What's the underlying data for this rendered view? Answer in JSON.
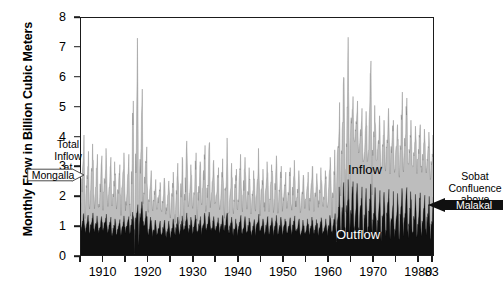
{
  "chart_data": {
    "type": "area",
    "title": "",
    "subtitle": "",
    "xlabel": "",
    "ylabel": "Monthly Flow in Billion Cubic Meters",
    "xlim": [
      1905,
      1983.5
    ],
    "ylim": [
      0,
      8
    ],
    "grid": false,
    "legend_position": "in-plot annotations",
    "y_ticks": [
      0,
      1,
      2,
      3,
      4,
      5,
      6,
      7,
      8
    ],
    "y_tick_labels": [
      "0",
      "1",
      "2",
      "3",
      "4",
      "5",
      "6",
      "7",
      "8"
    ],
    "x_ticks": [
      1905,
      1910,
      1915,
      1920,
      1925,
      1930,
      1935,
      1940,
      1945,
      1950,
      1955,
      1960,
      1965,
      1970,
      1975,
      1980,
      1983
    ],
    "x_tick_labels": [
      "",
      "1910",
      "",
      "1920",
      "",
      "1930",
      "",
      "1940",
      "",
      "1950",
      "",
      "1960",
      "",
      "1970",
      "",
      "1980",
      "83"
    ],
    "colors": {
      "inflow_fill": "#bdbdbd",
      "outflow_fill": "#101010",
      "axis": "#1b1b1b",
      "background": "#ffffff",
      "inflow_label_color": "#000000",
      "outflow_label_color": "#ffffff"
    },
    "series": [
      {
        "name": "Inflow",
        "description": "Total Inflow at Mongalla",
        "fill": "#bdbdbd",
        "stacking": "overlay-top",
        "annual_mean": [
          2.45,
          2.38,
          2.52,
          2.35,
          2.3,
          2.55,
          2.28,
          2.2,
          2.15,
          2.4,
          2.32,
          2.48,
          3.1,
          3.35,
          2.6,
          2.1,
          1.95,
          1.88,
          1.92,
          1.85,
          1.98,
          2.05,
          2.12,
          2.35,
          2.18,
          2.28,
          2.22,
          2.4,
          2.45,
          2.25,
          2.18,
          2.3,
          2.42,
          2.2,
          2.1,
          2.35,
          2.28,
          2.15,
          2.05,
          2.38,
          2.12,
          2.25,
          2.18,
          2.3,
          2.2,
          2.08,
          2.15,
          2.28,
          2.12,
          2.0,
          2.1,
          2.22,
          2.05,
          2.18,
          2.12,
          2.35,
          2.28,
          3.35,
          4.15,
          4.0,
          4.45,
          4.3,
          3.95,
          3.75,
          4.25,
          3.95,
          3.7,
          3.55,
          3.8,
          3.62,
          3.5,
          3.72,
          3.88,
          3.6,
          3.45,
          3.55,
          3.4,
          3.3,
          3.25
        ],
        "annual_max": [
          4.05,
          3.5,
          3.75,
          3.4,
          3.35,
          3.6,
          3.3,
          3.15,
          3.05,
          3.45,
          3.4,
          5.2,
          7.32,
          5.6,
          3.65,
          2.85,
          2.55,
          2.45,
          2.6,
          2.5,
          2.8,
          3.1,
          3.3,
          3.85,
          3.05,
          3.45,
          3.15,
          3.7,
          3.8,
          3.2,
          2.95,
          3.25,
          3.95,
          3.1,
          2.9,
          3.4,
          3.3,
          2.95,
          2.85,
          3.6,
          2.9,
          3.15,
          3.05,
          3.35,
          3.0,
          2.8,
          2.95,
          3.2,
          2.85,
          2.7,
          2.8,
          3.0,
          2.75,
          2.95,
          2.85,
          3.3,
          3.55,
          5.15,
          6.0,
          7.35,
          5.35,
          5.2,
          4.95,
          4.85,
          6.55,
          5.05,
          4.7,
          4.55,
          4.95,
          4.55,
          4.4,
          5.5,
          5.3,
          4.55,
          4.35,
          4.4,
          4.25,
          4.15,
          4.05
        ]
      },
      {
        "name": "Outflow",
        "description": "Sobat Confluence above Malakal",
        "fill": "#101010",
        "stacking": "base",
        "annual_mean": [
          1.05,
          1.02,
          1.08,
          1.0,
          0.98,
          1.06,
          0.95,
          0.92,
          0.9,
          1.0,
          0.98,
          1.1,
          1.25,
          1.35,
          1.12,
          0.95,
          0.88,
          0.85,
          0.88,
          0.85,
          0.9,
          0.95,
          0.98,
          1.05,
          0.96,
          1.0,
          0.98,
          1.05,
          1.08,
          0.98,
          0.95,
          1.0,
          1.05,
          0.96,
          0.92,
          1.0,
          0.98,
          0.94,
          0.9,
          1.02,
          0.92,
          0.98,
          0.95,
          1.0,
          0.96,
          0.92,
          0.95,
          0.98,
          0.92,
          0.88,
          0.92,
          0.96,
          0.9,
          0.95,
          0.92,
          1.0,
          0.98,
          1.25,
          1.45,
          1.42,
          1.5,
          1.48,
          1.4,
          1.35,
          1.46,
          1.38,
          1.32,
          1.28,
          1.35,
          1.3,
          1.26,
          1.34,
          1.38,
          1.3,
          1.25,
          1.28,
          1.24,
          1.22,
          1.2
        ],
        "annual_max": [
          1.4,
          1.35,
          1.42,
          1.32,
          1.3,
          1.38,
          1.28,
          1.22,
          1.2,
          1.32,
          1.3,
          1.45,
          1.7,
          1.8,
          1.48,
          1.28,
          1.18,
          1.15,
          1.18,
          1.15,
          1.22,
          1.28,
          1.32,
          1.42,
          1.28,
          1.35,
          1.3,
          1.42,
          1.45,
          1.3,
          1.26,
          1.34,
          1.42,
          1.28,
          1.22,
          1.34,
          1.3,
          1.25,
          1.2,
          1.38,
          1.22,
          1.3,
          1.26,
          1.34,
          1.28,
          1.22,
          1.26,
          1.32,
          1.22,
          1.18,
          1.22,
          1.28,
          1.2,
          1.26,
          1.22,
          1.34,
          1.4,
          2.3,
          2.45,
          2.55,
          2.48,
          2.42,
          2.3,
          2.25,
          2.4,
          2.28,
          2.18,
          2.12,
          2.22,
          2.15,
          2.08,
          2.25,
          2.28,
          2.14,
          2.05,
          2.1,
          2.02,
          1.98,
          1.95
        ]
      }
    ],
    "annotations": [
      {
        "id": "mongalla",
        "lines": [
          "Total",
          "Inflow",
          "at"
        ],
        "banner_text": "Mongalla",
        "banner_style": "white-arrow-right",
        "points_to": "inflow-envelope-left"
      },
      {
        "id": "malakal",
        "lines": [
          "Sobat",
          "Confluence",
          "above"
        ],
        "banner_text": "Malakal",
        "banner_style": "black-arrow-left",
        "points_to": "outflow-envelope-right"
      },
      {
        "id": "inflow-label",
        "text": "Inflow"
      },
      {
        "id": "outflow-label",
        "text": "Outflow"
      }
    ]
  },
  "axes": {
    "y_title": "Monthly Flow in Billion Cubic Meters",
    "y_labels": [
      "8",
      "7",
      "6",
      "5",
      "4",
      "3",
      "2",
      "1",
      "0"
    ],
    "x_labels": [
      "1910",
      "1920",
      "1930",
      "1940",
      "1950",
      "1960",
      "1970",
      "1980",
      "83"
    ]
  },
  "labels": {
    "inflow": "Inflow",
    "outflow": "Outflow"
  },
  "callouts": {
    "mongalla": {
      "line1": "Total",
      "line2": "Inflow",
      "line3": "at",
      "banner": "Mongalla"
    },
    "malakal": {
      "line1": "Sobat",
      "line2": "Confluence",
      "line3": "above",
      "banner": "Malakal"
    }
  }
}
